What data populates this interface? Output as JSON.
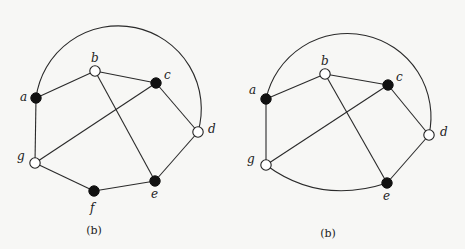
{
  "figures": [
    {
      "id": "left",
      "caption": "(b)",
      "nodes": [
        {
          "name": "a",
          "x": 36,
          "y": 98,
          "filled": true,
          "lx": 20,
          "ly": 101
        },
        {
          "name": "b",
          "x": 95,
          "y": 71,
          "filled": false,
          "lx": 91,
          "ly": 62
        },
        {
          "name": "c",
          "x": 156,
          "y": 83,
          "filled": true,
          "lx": 164,
          "ly": 79
        },
        {
          "name": "d",
          "x": 198,
          "y": 132,
          "filled": false,
          "lx": 208,
          "ly": 133
        },
        {
          "name": "e",
          "x": 155,
          "y": 181,
          "filled": true,
          "lx": 151,
          "ly": 198
        },
        {
          "name": "f",
          "x": 94,
          "y": 191,
          "filled": true,
          "lx": 90,
          "ly": 212
        },
        {
          "name": "g",
          "x": 35,
          "y": 163,
          "filled": false,
          "lx": 17,
          "ly": 160
        }
      ],
      "edges": [
        [
          "a",
          "b"
        ],
        [
          "b",
          "c"
        ],
        [
          "b",
          "e"
        ],
        [
          "c",
          "g"
        ],
        [
          "c",
          "d"
        ],
        [
          "d",
          "e"
        ],
        [
          "e",
          "f"
        ],
        [
          "f",
          "g"
        ],
        [
          "g",
          "a"
        ]
      ],
      "arc": {
        "from": "a",
        "to": "d",
        "path": "M36,98 A83,83 0 1 1 198,132"
      }
    },
    {
      "id": "right",
      "caption": "(b)",
      "nodes": [
        {
          "name": "a",
          "x": 266,
          "y": 99,
          "filled": true,
          "lx": 249,
          "ly": 94
        },
        {
          "name": "b",
          "x": 325,
          "y": 74,
          "filled": false,
          "lx": 321,
          "ly": 65
        },
        {
          "name": "c",
          "x": 388,
          "y": 85,
          "filled": true,
          "lx": 396,
          "ly": 81
        },
        {
          "name": "d",
          "x": 429,
          "y": 135,
          "filled": false,
          "lx": 440,
          "ly": 136
        },
        {
          "name": "e",
          "x": 387,
          "y": 183,
          "filled": true,
          "lx": 383,
          "ly": 200
        },
        {
          "name": "g",
          "x": 266,
          "y": 165,
          "filled": false,
          "lx": 247,
          "ly": 163
        }
      ],
      "edges": [
        [
          "a",
          "b"
        ],
        [
          "b",
          "c"
        ],
        [
          "b",
          "e"
        ],
        [
          "c",
          "g"
        ],
        [
          "c",
          "d"
        ],
        [
          "d",
          "e"
        ],
        [
          "g",
          "a"
        ]
      ],
      "arc": {
        "from": "a",
        "to": "d",
        "path": "M266,99 A83,83 0 1 1 429,135"
      },
      "curve": {
        "from": "g",
        "to": "e",
        "path": "M266,165 Q320,205 387,183"
      }
    }
  ]
}
